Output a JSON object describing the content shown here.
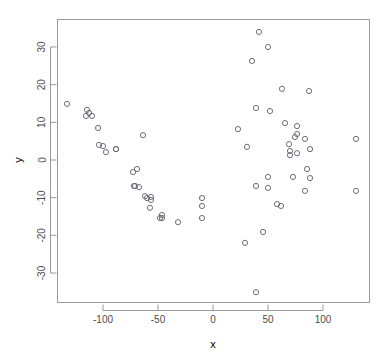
{
  "chart_data": {
    "type": "scatter",
    "title": "",
    "xlabel": "x",
    "ylabel": "y",
    "xlim": [
      -141,
      143
    ],
    "ylim": [
      -39,
      37
    ],
    "xticks": [
      -100,
      -50,
      0,
      50,
      100
    ],
    "yticks": [
      -30,
      -20,
      -10,
      0,
      10,
      20,
      30
    ],
    "xtick_labels": [
      "-100",
      "-50",
      "0",
      "50",
      "100"
    ],
    "ytick_labels": [
      "-30",
      "-20",
      "-10",
      "0",
      "10",
      "20",
      "30"
    ],
    "grid": false,
    "legend": null,
    "marker": "open-circle",
    "marker_color": "#6e6e7a",
    "frame_color": "#9a9a9a",
    "n_points": 62,
    "points": [
      {
        "x": -132.7,
        "y": 14.9
      },
      {
        "x": -114.5,
        "y": 13.3
      },
      {
        "x": -112.7,
        "y": 12.5
      },
      {
        "x": -115.5,
        "y": 11.7
      },
      {
        "x": -110.0,
        "y": 11.7
      },
      {
        "x": -104.5,
        "y": 8.5
      },
      {
        "x": -103.6,
        "y": 4.0
      },
      {
        "x": -100.0,
        "y": 3.7
      },
      {
        "x": -97.3,
        "y": 2.1
      },
      {
        "x": -88.2,
        "y": 2.9
      },
      {
        "x": -63.6,
        "y": 6.6
      },
      {
        "x": -88.2,
        "y": 2.9
      },
      {
        "x": -72.7,
        "y": -3.2
      },
      {
        "x": -69.1,
        "y": -2.4
      },
      {
        "x": -71.8,
        "y": -6.9
      },
      {
        "x": -61.8,
        "y": -9.6
      },
      {
        "x": -56.4,
        "y": -9.8
      },
      {
        "x": -70.9,
        "y": -6.9
      },
      {
        "x": -60.0,
        "y": -10.1
      },
      {
        "x": -56.4,
        "y": -10.6
      },
      {
        "x": -57.3,
        "y": -12.7
      },
      {
        "x": -46.4,
        "y": -14.6
      },
      {
        "x": -46.4,
        "y": -15.4
      },
      {
        "x": -31.8,
        "y": -16.5
      },
      {
        "x": -10.0,
        "y": -10.1
      },
      {
        "x": -10.0,
        "y": -12.2
      },
      {
        "x": -10.0,
        "y": -15.4
      },
      {
        "x": 41.8,
        "y": 34.0
      },
      {
        "x": 50.0,
        "y": 30.0
      },
      {
        "x": 35.5,
        "y": 26.3
      },
      {
        "x": 62.7,
        "y": 18.9
      },
      {
        "x": 39.1,
        "y": 13.8
      },
      {
        "x": 51.8,
        "y": 13.0
      },
      {
        "x": 22.7,
        "y": 8.2
      },
      {
        "x": 65.5,
        "y": 9.8
      },
      {
        "x": 76.4,
        "y": 9.0
      },
      {
        "x": 76.4,
        "y": 6.9
      },
      {
        "x": 87.3,
        "y": 18.3
      },
      {
        "x": 30.9,
        "y": 3.5
      },
      {
        "x": 69.1,
        "y": 4.2
      },
      {
        "x": 70.0,
        "y": 2.4
      },
      {
        "x": 83.6,
        "y": 5.6
      },
      {
        "x": 88.2,
        "y": 2.9
      },
      {
        "x": 70.0,
        "y": 1.3
      },
      {
        "x": 76.4,
        "y": 1.8
      },
      {
        "x": 130.0,
        "y": 5.6
      },
      {
        "x": 50.0,
        "y": -4.5
      },
      {
        "x": 72.7,
        "y": -4.5
      },
      {
        "x": 39.1,
        "y": -6.9
      },
      {
        "x": 50.0,
        "y": -7.4
      },
      {
        "x": 88.2,
        "y": -4.8
      },
      {
        "x": 83.6,
        "y": -8.2
      },
      {
        "x": 130.0,
        "y": -8.2
      },
      {
        "x": 61.8,
        "y": -12.2
      },
      {
        "x": 58.2,
        "y": -11.7
      },
      {
        "x": 45.5,
        "y": -19.1
      },
      {
        "x": 29.1,
        "y": -22.0
      },
      {
        "x": 39.1,
        "y": -35.1
      },
      {
        "x": -67.3,
        "y": -7.2
      },
      {
        "x": -48.2,
        "y": -15.4
      },
      {
        "x": 85.5,
        "y": -2.4
      },
      {
        "x": 74.5,
        "y": 6.1
      }
    ]
  },
  "axes": {
    "x_title": "x",
    "y_title": "y"
  }
}
